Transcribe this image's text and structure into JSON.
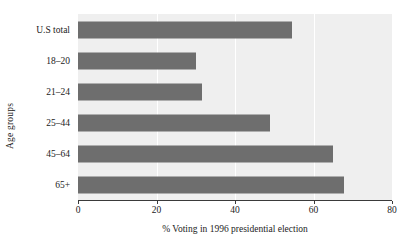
{
  "chart_data": {
    "type": "bar",
    "orientation": "horizontal",
    "title": "",
    "xlabel": "% Voting in 1996 presidential election",
    "ylabel": "Age groups",
    "categories": [
      "U.S total",
      "18–20",
      "21–24",
      "25–44",
      "45–64",
      "65+"
    ],
    "values": [
      54.6,
      30.0,
      31.5,
      49.0,
      65.0,
      67.7
    ],
    "xlim": [
      0,
      80
    ],
    "xticks": [
      0,
      20,
      40,
      60,
      80
    ],
    "xtick_labels": [
      "0",
      "20",
      "40",
      "60",
      "80"
    ],
    "grid": "vertical-white-gridlines",
    "legend": "none",
    "bar_color": "#6e6e6e",
    "panel_color": "#efefef",
    "gridline_color": "#ffffff",
    "axis_color": "#3a3a3a"
  }
}
